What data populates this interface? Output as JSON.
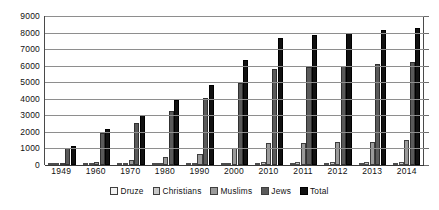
{
  "chart_data": {
    "type": "bar",
    "title": "",
    "subtitle": "",
    "xlabel": "",
    "ylabel": "",
    "ylim": [
      0,
      9000
    ],
    "ytick_step": 1000,
    "yticks": [
      "0",
      "1000",
      "2000",
      "3000",
      "4000",
      "5000",
      "6000",
      "7000",
      "8000",
      "9000"
    ],
    "grid": true,
    "legend_position": "bottom",
    "categories": [
      "1949",
      "1960",
      "1970",
      "1980",
      "1990",
      "2000",
      "2010",
      "2011",
      "2012",
      "2013",
      "2014"
    ],
    "series": [
      {
        "name": "Druze",
        "color": "#f2f2f2",
        "values": [
          15,
          25,
          36,
          50,
          82,
          104,
          127,
          130,
          133,
          136,
          140
        ]
      },
      {
        "name": "Christians",
        "color": "#c9c9c9",
        "values": [
          34,
          50,
          75,
          89,
          115,
          135,
          153,
          155,
          158,
          161,
          165
        ]
      },
      {
        "name": "Muslims",
        "color": "#9a9a9a",
        "values": [
          111,
          166,
          328,
          498,
          677,
          1005,
          1320,
          1354,
          1387,
          1420,
          1490
        ]
      },
      {
        "name": "Jews",
        "color": "#5a5a5a",
        "values": [
          1014,
          1911,
          2561,
          3283,
          4060,
          4955,
          5803,
          5901,
          5999,
          6104,
          6219
        ]
      },
      {
        "name": "Total",
        "color": "#111111",
        "values": [
          1174,
          2150,
          3000,
          3922,
          4822,
          6369,
          7695,
          7837,
          7984,
          8135,
          8297
        ]
      }
    ]
  },
  "legend": {
    "items": [
      {
        "label": "Druze"
      },
      {
        "label": "Christians"
      },
      {
        "label": "Muslims"
      },
      {
        "label": "Jews"
      },
      {
        "label": "Total"
      }
    ]
  }
}
